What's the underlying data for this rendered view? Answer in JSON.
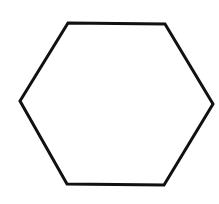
{
  "diagram": {
    "shape": "hexagon",
    "label": "",
    "stroke_color": "#111111",
    "fill_color": "none",
    "background_color": "#ffffff",
    "stroke_width": 3,
    "vertices": [
      [
        68,
        23
      ],
      [
        165,
        24
      ],
      [
        213,
        104
      ],
      [
        164,
        185
      ],
      [
        67,
        184
      ],
      [
        20,
        101
      ]
    ],
    "points": "68,23 165,24 213,104 164,185 67,184 20,101"
  }
}
